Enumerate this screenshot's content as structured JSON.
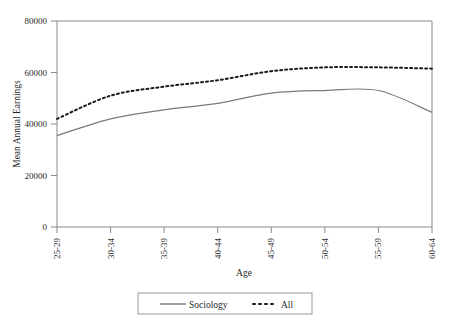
{
  "chart_data": {
    "type": "line",
    "title": "",
    "xlabel": "Age",
    "ylabel": "Mean Annual Earnings",
    "categories": [
      "25-29",
      "30-34",
      "35-39",
      "40-44",
      "45-49",
      "50-54",
      "55-59",
      "60-64"
    ],
    "series": [
      {
        "name": "Sociology",
        "style": "solid",
        "color": "#7a7a7a",
        "values": [
          35500,
          42000,
          45500,
          48000,
          52000,
          53000,
          53000,
          44500
        ]
      },
      {
        "name": "All",
        "style": "dotted",
        "color": "#1a1a1a",
        "values": [
          42000,
          51000,
          54500,
          57000,
          60500,
          62000,
          62000,
          61500
        ]
      }
    ],
    "ylim": [
      0,
      80000
    ],
    "yticks": [
      0,
      20000,
      40000,
      60000,
      80000
    ],
    "ytick_labels": [
      "0",
      "20000",
      "40000",
      "60000",
      "80000"
    ],
    "xtick_labels": [
      "25-29",
      "30-34",
      "35-39",
      "40-44",
      "45-49",
      "50-54",
      "55-59",
      "60-64"
    ],
    "grid": false,
    "legend_position": "bottom-center",
    "legend_entries": [
      "Sociology",
      "All"
    ]
  },
  "axes": {
    "x_title": "Age",
    "y_title": "Mean Annual Earnings"
  },
  "legend": {
    "items": [
      {
        "label": "Sociology",
        "marker": "solid-line-swatch"
      },
      {
        "label": "All",
        "marker": "dotted-line-swatch"
      }
    ]
  },
  "colors": {
    "sociology_line": "#7a7a7a",
    "all_line": "#1a1a1a",
    "axis": "#8a8a8a",
    "text": "#1f1f1f",
    "background": "#ffffff"
  }
}
